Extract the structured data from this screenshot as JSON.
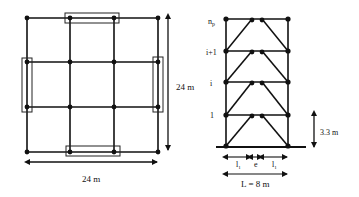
{
  "plan": {
    "width_label": "24 m",
    "height_label": "24 m",
    "grid_x": [
      27,
      70,
      114,
      158
    ],
    "grid_y": [
      18,
      62,
      107,
      152
    ],
    "link_boxes": [
      {
        "name": "top",
        "x": 65,
        "y": 13,
        "w": 54,
        "h": 10
      },
      {
        "name": "bottom",
        "x": 66,
        "y": 146,
        "w": 54,
        "h": 10
      },
      {
        "name": "left",
        "x": 22,
        "y": 58,
        "w": 10,
        "h": 54
      },
      {
        "name": "right",
        "x": 153,
        "y": 57,
        "w": 10,
        "h": 55
      }
    ]
  },
  "elevation": {
    "floor_labels": [
      "n_p",
      "i+1",
      "i",
      "1"
    ],
    "storey_height_label": "3.3 m",
    "span_label": "L = 8 m",
    "segment_labels": [
      "l_1",
      "e",
      "l_1"
    ],
    "col_x": [
      226,
      288
    ],
    "floor_y": [
      19,
      51,
      82,
      115,
      146
    ],
    "link_x": [
      252,
      262
    ]
  }
}
